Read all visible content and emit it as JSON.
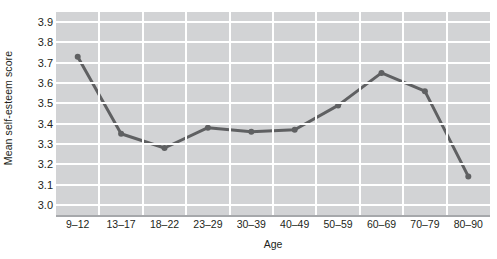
{
  "chart_data": {
    "type": "line",
    "title": "",
    "xlabel": "Age",
    "ylabel": "Mean self-esteem score",
    "categories": [
      "9–12",
      "13–17",
      "18–22",
      "23–29",
      "30–39",
      "40–49",
      "50–59",
      "60–69",
      "70–79",
      "80–90"
    ],
    "values": [
      3.73,
      3.35,
      3.28,
      3.38,
      3.36,
      3.37,
      3.49,
      3.65,
      3.56,
      3.14
    ],
    "series": [
      {
        "name": "Mean self-esteem score",
        "values": [
          3.73,
          3.35,
          3.28,
          3.38,
          3.36,
          3.37,
          3.49,
          3.65,
          3.56,
          3.14
        ]
      }
    ],
    "yticks": [
      "3.0",
      "3.1",
      "3.2",
      "3.3",
      "3.4",
      "3.5",
      "3.6",
      "3.7",
      "3.8",
      "3.9"
    ],
    "ytick_values": [
      3.0,
      3.1,
      3.2,
      3.3,
      3.4,
      3.5,
      3.6,
      3.7,
      3.8,
      3.9
    ],
    "ylim": [
      2.95,
      3.95
    ],
    "grid": "both",
    "legend": "none",
    "colors": {
      "plot_background": "#d2d3d5",
      "gridline": "#ffffff",
      "line": "#5f6062",
      "marker": "#5f6062",
      "axis": "#a6a8ab",
      "text": "#231f20",
      "page_background": "#ffffff"
    },
    "line_width": 3,
    "marker_size": 3
  }
}
